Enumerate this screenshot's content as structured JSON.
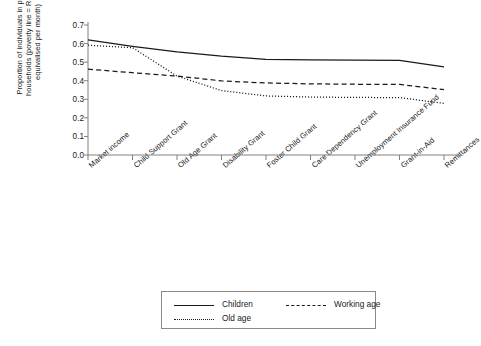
{
  "chart_data": {
    "type": "line",
    "title": "",
    "xlabel": "",
    "ylabel": "Proportion of individuals in poor households (poverty line = R462 equivalised per month)",
    "ylim": [
      0.0,
      0.7
    ],
    "yticks": [
      "0.0",
      "0.1",
      "0.2",
      "0.3",
      "0.4",
      "0.5",
      "0.6",
      "0.7"
    ],
    "ytick_values": [
      0.0,
      0.1,
      0.2,
      0.3,
      0.4,
      0.5,
      0.6,
      0.7
    ],
    "grid": false,
    "legend_position": "bottom",
    "categories": [
      "Market income",
      "Child Support Grant",
      "Old Age Grant",
      "Disability Grant",
      "Foster Child Grant",
      "Care Dependency Grant",
      "Unemployment Insurance Fund",
      "Grant-in-Aid",
      "Remittances"
    ],
    "series": [
      {
        "name": "Children",
        "style": "solid",
        "color": "#1a1a1a",
        "values": [
          0.62,
          0.585,
          0.555,
          0.532,
          0.515,
          0.512,
          0.511,
          0.51,
          0.475
        ]
      },
      {
        "name": "Working age",
        "style": "dashed",
        "color": "#1a1a1a",
        "values": [
          0.462,
          0.443,
          0.425,
          0.399,
          0.388,
          0.383,
          0.381,
          0.38,
          0.352
        ]
      },
      {
        "name": "Old age",
        "style": "dotted",
        "color": "#1a1a1a",
        "values": [
          0.591,
          0.578,
          0.425,
          0.347,
          0.318,
          0.312,
          0.31,
          0.309,
          0.278
        ]
      }
    ]
  },
  "ylabel": {
    "line1": "Proportion of individuals in poor",
    "line2": "households (poverty line = R462",
    "line3": "equivalised per month)"
  },
  "legend": {
    "entries": [
      {
        "label": "Children",
        "style": "solid"
      },
      {
        "label": "Working age",
        "style": "dashed"
      },
      {
        "label": "Old age",
        "style": "dotted"
      }
    ]
  }
}
